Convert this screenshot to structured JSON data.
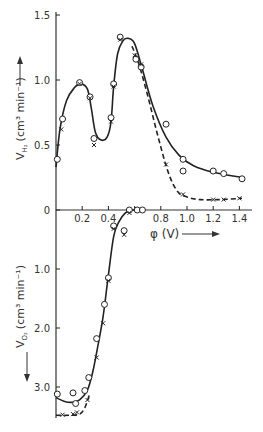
{
  "chart_data": [
    {
      "type": "scatter",
      "panel": "upper",
      "title": "",
      "xlabel": "φ (V)",
      "ylabel": "V_H2 (cm³ min⁻¹)",
      "xlim": [
        0,
        1.45
      ],
      "ylim": [
        0,
        1.5
      ],
      "x_ticks": [
        "0.2",
        "0.4",
        "0.8",
        "1.0",
        "1.2",
        "1.4"
      ],
      "y_ticks": [
        "0",
        "0.5",
        "1.0",
        "1.5"
      ],
      "grid": false,
      "series": [
        {
          "name": "circles (solid curve)",
          "marker": "o",
          "line": "solid",
          "points": [
            [
              0.01,
              0.39
            ],
            [
              0.05,
              0.7
            ],
            [
              0.18,
              0.98
            ],
            [
              0.26,
              0.87
            ],
            [
              0.29,
              0.55
            ],
            [
              0.42,
              0.71
            ],
            [
              0.44,
              0.97
            ],
            [
              0.49,
              1.33
            ],
            [
              0.61,
              1.16
            ],
            [
              0.65,
              1.1
            ],
            [
              0.84,
              0.66
            ],
            [
              0.97,
              0.39
            ],
            [
              0.97,
              0.3
            ],
            [
              1.2,
              0.3
            ],
            [
              1.28,
              0.28
            ],
            [
              1.42,
              0.24
            ]
          ]
        },
        {
          "name": "crosses (dashed curve)",
          "marker": "x",
          "line": "dashed",
          "points": [
            [
              0.04,
              0.62
            ],
            [
              0.18,
              0.97
            ],
            [
              0.26,
              0.86
            ],
            [
              0.29,
              0.5
            ],
            [
              0.42,
              0.68
            ],
            [
              0.44,
              0.95
            ],
            [
              0.49,
              1.31
            ],
            [
              0.6,
              1.19
            ],
            [
              0.65,
              1.12
            ],
            [
              0.84,
              0.35
            ],
            [
              0.97,
              0.12
            ],
            [
              1.2,
              0.08
            ],
            [
              1.28,
              0.08
            ],
            [
              1.4,
              0.09
            ]
          ]
        }
      ],
      "curve_solid": [
        [
          0.0,
          0.33
        ],
        [
          0.03,
          0.62
        ],
        [
          0.08,
          0.84
        ],
        [
          0.14,
          0.94
        ],
        [
          0.19,
          0.97
        ],
        [
          0.24,
          0.93
        ],
        [
          0.27,
          0.78
        ],
        [
          0.3,
          0.6
        ],
        [
          0.34,
          0.54
        ],
        [
          0.39,
          0.56
        ],
        [
          0.42,
          0.68
        ],
        [
          0.44,
          0.95
        ],
        [
          0.47,
          1.2
        ],
        [
          0.51,
          1.3
        ],
        [
          0.55,
          1.32
        ],
        [
          0.6,
          1.28
        ],
        [
          0.66,
          1.08
        ],
        [
          0.74,
          0.8
        ],
        [
          0.84,
          0.56
        ],
        [
          0.94,
          0.42
        ],
        [
          1.05,
          0.34
        ],
        [
          1.2,
          0.29
        ],
        [
          1.42,
          0.25
        ]
      ],
      "curve_dashed": [
        [
          0.58,
          1.26
        ],
        [
          0.63,
          1.13
        ],
        [
          0.7,
          0.88
        ],
        [
          0.78,
          0.56
        ],
        [
          0.86,
          0.28
        ],
        [
          0.93,
          0.14
        ],
        [
          1.0,
          0.1
        ],
        [
          1.1,
          0.08
        ],
        [
          1.25,
          0.08
        ],
        [
          1.42,
          0.09
        ]
      ]
    },
    {
      "type": "scatter",
      "panel": "lower",
      "xlabel": "φ (V)",
      "ylabel": "V_O2 (cm³ min⁻¹)",
      "ylim": [
        0,
        3.5
      ],
      "y_inverted": true,
      "y_ticks": [
        "1.0",
        "2.0",
        "3.0"
      ],
      "series": [
        {
          "name": "circles (solid curve)",
          "marker": "o",
          "line": "solid",
          "points": [
            [
              0.01,
              3.12
            ],
            [
              0.13,
              3.1
            ],
            [
              0.15,
              3.28
            ],
            [
              0.22,
              3.06
            ],
            [
              0.25,
              2.84
            ],
            [
              0.31,
              2.18
            ],
            [
              0.37,
              1.6
            ],
            [
              0.4,
              1.15
            ],
            [
              0.44,
              0.27
            ],
            [
              0.52,
              0.35
            ],
            [
              0.56,
              0.0
            ],
            [
              0.62,
              0.0
            ],
            [
              0.66,
              0.0
            ]
          ]
        },
        {
          "name": "crosses (dashed curve)",
          "marker": "x",
          "line": "dashed",
          "points": [
            [
              0.05,
              3.47
            ],
            [
              0.13,
              3.46
            ],
            [
              0.16,
              3.43
            ],
            [
              0.24,
              3.22
            ],
            [
              0.31,
              2.5
            ],
            [
              0.36,
              1.92
            ],
            [
              0.4,
              1.2
            ],
            [
              0.44,
              0.32
            ],
            [
              0.52,
              0.42
            ],
            [
              0.56,
              0.05
            ]
          ]
        }
      ],
      "curve_solid": [
        [
          0.0,
          3.18
        ],
        [
          0.06,
          3.24
        ],
        [
          0.12,
          3.26
        ],
        [
          0.18,
          3.22
        ],
        [
          0.24,
          3.05
        ],
        [
          0.28,
          2.75
        ],
        [
          0.32,
          2.3
        ],
        [
          0.36,
          1.8
        ],
        [
          0.4,
          1.1
        ],
        [
          0.44,
          0.45
        ],
        [
          0.48,
          0.2
        ],
        [
          0.53,
          0.05
        ],
        [
          0.58,
          0.0
        ],
        [
          0.68,
          0.0
        ]
      ],
      "curve_dashed": [
        [
          0.0,
          3.48
        ],
        [
          0.1,
          3.48
        ],
        [
          0.18,
          3.46
        ],
        [
          0.22,
          3.35
        ],
        [
          0.26,
          3.1
        ]
      ]
    }
  ],
  "labels": {
    "upper_y_ticks": [
      "1.5",
      "1.0",
      "0.5",
      "0"
    ],
    "lower_y_ticks": [
      "1.0",
      "2.0",
      "3.0"
    ],
    "x_ticks": [
      "0.2",
      "0.4",
      "0.8",
      "1.0",
      "1.2",
      "1.4"
    ],
    "x_axis_title": "φ (V)",
    "upper_y_title": "V",
    "upper_y_sub": "H₂",
    "upper_y_unit": "(cm³ min⁻¹)",
    "lower_y_title": "V",
    "lower_y_sub": "O₂",
    "lower_y_unit": "(cm³ min⁻¹)"
  },
  "colors": {
    "ink": "#222222",
    "label": "#333333"
  }
}
